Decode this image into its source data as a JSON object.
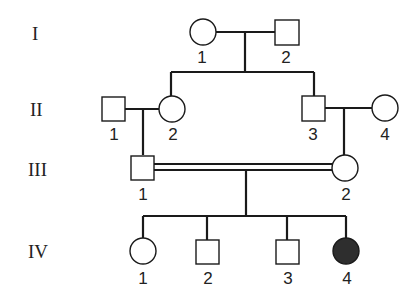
{
  "generations": [
    {
      "label": "I",
      "individuals": [
        {
          "id": "1",
          "sex": "female",
          "shape": "circle",
          "affected": false
        },
        {
          "id": "2",
          "sex": "male",
          "shape": "square",
          "affected": false
        }
      ]
    },
    {
      "label": "II",
      "individuals": [
        {
          "id": "1",
          "sex": "male",
          "shape": "square",
          "affected": false
        },
        {
          "id": "2",
          "sex": "female",
          "shape": "circle",
          "affected": false
        },
        {
          "id": "3",
          "sex": "male",
          "shape": "square",
          "affected": false
        },
        {
          "id": "4",
          "sex": "female",
          "shape": "circle",
          "affected": false
        }
      ]
    },
    {
      "label": "III",
      "individuals": [
        {
          "id": "1",
          "sex": "male",
          "shape": "square",
          "affected": false
        },
        {
          "id": "2",
          "sex": "female",
          "shape": "circle",
          "affected": false
        }
      ]
    },
    {
      "label": "IV",
      "individuals": [
        {
          "id": "1",
          "sex": "female",
          "shape": "circle",
          "affected": false
        },
        {
          "id": "2",
          "sex": "male",
          "shape": "square",
          "affected": false
        },
        {
          "id": "3",
          "sex": "male",
          "shape": "square",
          "affected": false
        },
        {
          "id": "4",
          "sex": "female",
          "shape": "circle",
          "affected": true
        }
      ]
    }
  ],
  "relationships": [
    {
      "type": "mating",
      "partners": [
        "I-1",
        "I-2"
      ],
      "children": [
        "II-2",
        "II-3"
      ]
    },
    {
      "type": "mating",
      "partners": [
        "II-1",
        "II-2"
      ],
      "children": [
        "III-1"
      ]
    },
    {
      "type": "mating",
      "partners": [
        "II-3",
        "II-4"
      ],
      "children": [
        "III-2"
      ]
    },
    {
      "type": "consanguineous",
      "partners": [
        "III-1",
        "III-2"
      ],
      "children": [
        "IV-1",
        "IV-2",
        "IV-3",
        "IV-4"
      ]
    }
  ],
  "colors": {
    "affected": "#2e2e2e",
    "line": "#1a1a1a",
    "background": "#ffffff"
  }
}
